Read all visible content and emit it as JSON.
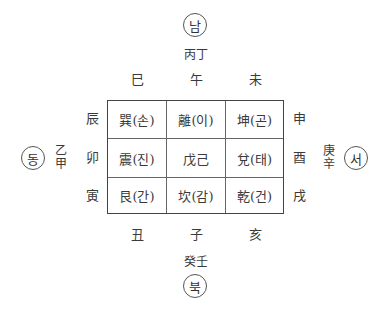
{
  "directions": {
    "south": {
      "label": "남",
      "stems": "丙丁"
    },
    "north": {
      "label": "북",
      "stems": "癸壬"
    },
    "east": {
      "label": "동",
      "stems": "乙甲"
    },
    "west": {
      "label": "서",
      "stems": "庚辛"
    }
  },
  "branches": {
    "top": [
      "巳",
      "午",
      "未"
    ],
    "bottom": [
      "丑",
      "子",
      "亥"
    ],
    "left": [
      "辰",
      "卯",
      "寅"
    ],
    "right": [
      "申",
      "酉",
      "戌"
    ]
  },
  "grid": [
    [
      "巽(손)",
      "離(이)",
      "坤(곤)"
    ],
    [
      "震(진)",
      "戊己",
      "兌(태)"
    ],
    [
      "艮(간)",
      "坎(감)",
      "乾(건)"
    ]
  ]
}
